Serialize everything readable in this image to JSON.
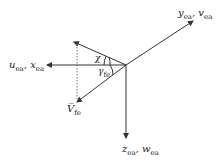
{
  "diagram": {
    "type": "coordinate-axes",
    "labels": {
      "y_axis": {
        "main": "y",
        "main_sub": "ea",
        "sep": ", ",
        "second": "v",
        "second_sub": "ea"
      },
      "x_axis": {
        "main": "u",
        "main_sub": "ea",
        "sep": ", ",
        "second": "x",
        "second_sub": "ea"
      },
      "z_axis": {
        "main": "z",
        "main_sub": "ea",
        "sep": ", ",
        "second": "w",
        "second_sub": "ea"
      },
      "velocity": {
        "main": "V̅",
        "main_sub": "fe"
      },
      "angle_chi": "χ",
      "angle_gamma": {
        "main": "γ",
        "main_sub": "fe"
      }
    },
    "colors": {
      "line": "#333333",
      "text": "#222222"
    }
  }
}
